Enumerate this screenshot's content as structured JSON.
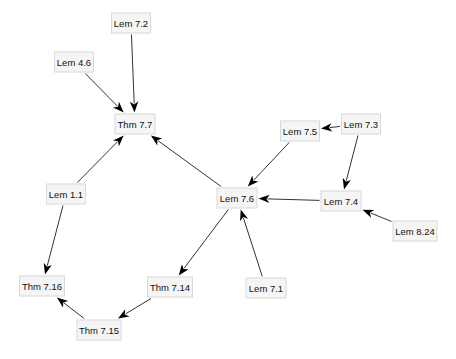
{
  "graph": {
    "title": "Dependency graph of theorems and lemmas",
    "colors": {
      "node_fill": "#f5f5f5",
      "node_border": "#d9d9d9",
      "edge": "#333333",
      "arrowhead": "#000000",
      "text": "#111111"
    },
    "nodes": [
      {
        "id": "lem72",
        "label": "Lem 7.2",
        "x": 131,
        "y": 23,
        "w": 40
      },
      {
        "id": "lem46",
        "label": "Lem 4.6",
        "x": 74,
        "y": 62,
        "w": 40
      },
      {
        "id": "thm77",
        "label": "Thm 7.7",
        "x": 135,
        "y": 124,
        "w": 41
      },
      {
        "id": "lem11",
        "label": "Lem 1.1",
        "x": 66,
        "y": 194,
        "w": 40
      },
      {
        "id": "lem76",
        "label": "Lem 7.6",
        "x": 237,
        "y": 198,
        "w": 41
      },
      {
        "id": "lem75",
        "label": "Lem 7.5",
        "x": 300,
        "y": 131,
        "w": 40
      },
      {
        "id": "lem73",
        "label": "Lem 7.3",
        "x": 361,
        "y": 124,
        "w": 40
      },
      {
        "id": "lem74",
        "label": "Lem 7.4",
        "x": 341,
        "y": 201,
        "w": 41
      },
      {
        "id": "lem824",
        "label": "Lem 8.24",
        "x": 415,
        "y": 231,
        "w": 45
      },
      {
        "id": "thm716",
        "label": "Thm 7.16",
        "x": 42,
        "y": 286,
        "w": 46
      },
      {
        "id": "thm714",
        "label": "Thm 7.14",
        "x": 170,
        "y": 287,
        "w": 46
      },
      {
        "id": "lem71",
        "label": "Lem 7.1",
        "x": 266,
        "y": 288,
        "w": 41
      },
      {
        "id": "thm715",
        "label": "Thm 7.15",
        "x": 99,
        "y": 330,
        "w": 45
      }
    ],
    "edges": [
      {
        "from": "lem72",
        "to": "thm77"
      },
      {
        "from": "lem46",
        "to": "thm77"
      },
      {
        "from": "lem11",
        "to": "thm77"
      },
      {
        "from": "lem76",
        "to": "thm77"
      },
      {
        "from": "lem11",
        "to": "thm716"
      },
      {
        "from": "lem75",
        "to": "lem76"
      },
      {
        "from": "lem73",
        "to": "lem75"
      },
      {
        "from": "lem73",
        "to": "lem74"
      },
      {
        "from": "lem74",
        "to": "lem76"
      },
      {
        "from": "lem824",
        "to": "lem74"
      },
      {
        "from": "lem71",
        "to": "lem76"
      },
      {
        "from": "lem76",
        "to": "thm714"
      },
      {
        "from": "thm714",
        "to": "thm715"
      },
      {
        "from": "thm715",
        "to": "thm716"
      }
    ]
  }
}
